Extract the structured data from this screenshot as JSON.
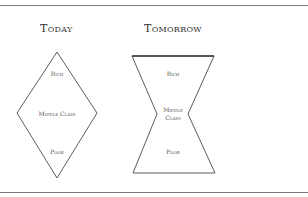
{
  "diagram": {
    "colors": {
      "line": "#4a4a4a",
      "rule": "#7a7a7a",
      "text": "#555555"
    },
    "today": {
      "title": "Today",
      "shape": "diamond",
      "labels": {
        "top": "Rich",
        "middle": "Middle Class",
        "bottom": "Poor"
      }
    },
    "tomorrow": {
      "title": "Tomorrow",
      "shape": "hourglass",
      "labels": {
        "top": "Rich",
        "middle_line1": "Middle",
        "middle_line2": "Class",
        "bottom": "Poor"
      }
    }
  }
}
